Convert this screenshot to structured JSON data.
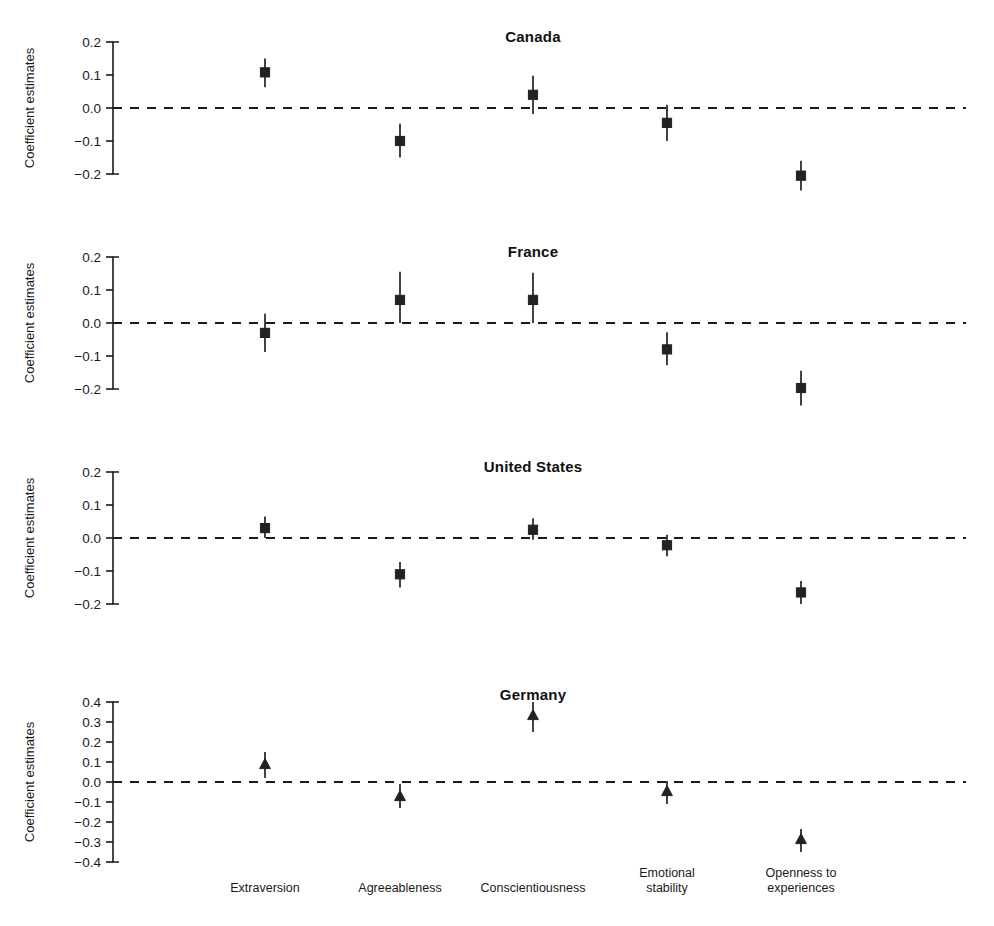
{
  "chart_data": {
    "type": "scatter",
    "title": "",
    "ylabel": "Coefficient estimates",
    "xlabel": "",
    "grid": false,
    "legend": "none",
    "categories": [
      "Extraversion",
      "Agreeableness",
      "Conscientiousness",
      "Emotional stability",
      "Openness to experiences"
    ],
    "category_lines": [
      [
        "Extraversion"
      ],
      [
        "Agreeableness"
      ],
      [
        "Conscientiousness"
      ],
      [
        "Emotional",
        "stability"
      ],
      [
        "Openness to",
        "experiences"
      ]
    ],
    "reference_line": 0.0,
    "panels": [
      {
        "title": "Canada",
        "marker": "square",
        "ylim": [
          -0.2,
          0.2
        ],
        "yticks": [
          0.2,
          0.1,
          0.0,
          -0.1,
          -0.2
        ],
        "ytick_labels": [
          "0.2",
          "0.1",
          "0.0",
          "−0.1",
          "−0.2"
        ],
        "values": [
          0.108,
          -0.1,
          0.04,
          -0.045,
          -0.205
        ],
        "ci_low": [
          0.063,
          -0.15,
          -0.018,
          -0.1,
          -0.25
        ],
        "ci_high": [
          0.15,
          -0.048,
          0.098,
          0.01,
          -0.16
        ]
      },
      {
        "title": "France",
        "marker": "square",
        "ylim": [
          -0.2,
          0.2
        ],
        "yticks": [
          0.2,
          0.1,
          0.0,
          -0.1,
          -0.2
        ],
        "ytick_labels": [
          "0.2",
          "0.1",
          "0.0",
          "−0.1",
          "−0.2"
        ],
        "values": [
          -0.03,
          0.07,
          0.07,
          -0.08,
          -0.197
        ],
        "ci_low": [
          -0.088,
          0.0,
          0.0,
          -0.128,
          -0.25
        ],
        "ci_high": [
          0.028,
          0.155,
          0.152,
          -0.028,
          -0.145
        ]
      },
      {
        "title": "United States",
        "marker": "square",
        "ylim": [
          -0.2,
          0.2
        ],
        "yticks": [
          0.2,
          0.1,
          0.0,
          -0.1,
          -0.2
        ],
        "ytick_labels": [
          "0.2",
          "0.1",
          "0.0",
          "−0.1",
          "−0.2"
        ],
        "values": [
          0.03,
          -0.11,
          0.025,
          -0.022,
          -0.165
        ],
        "ci_low": [
          0.0,
          -0.15,
          -0.005,
          -0.055,
          -0.2
        ],
        "ci_high": [
          0.065,
          -0.073,
          0.06,
          0.01,
          -0.13
        ]
      },
      {
        "title": "Germany",
        "marker": "triangle",
        "ylim": [
          -0.4,
          0.4
        ],
        "yticks": [
          0.4,
          0.3,
          0.2,
          0.1,
          0.0,
          -0.1,
          -0.2,
          -0.3,
          -0.4
        ],
        "ytick_labels": [
          "0.4",
          "0.3",
          "0.2",
          "0.1",
          "0.0",
          "−0.1",
          "−0.2",
          "−0.3",
          "−0.4"
        ],
        "values": [
          0.085,
          -0.075,
          0.33,
          -0.05,
          -0.29
        ],
        "ci_low": [
          0.02,
          -0.13,
          0.25,
          -0.11,
          -0.35
        ],
        "ci_high": [
          0.15,
          -0.01,
          0.4,
          0.005,
          -0.235
        ]
      }
    ]
  },
  "colors": {
    "ink": "#1a1a1a",
    "marker": "#222222",
    "axis": "#333333",
    "background": "#ffffff"
  }
}
